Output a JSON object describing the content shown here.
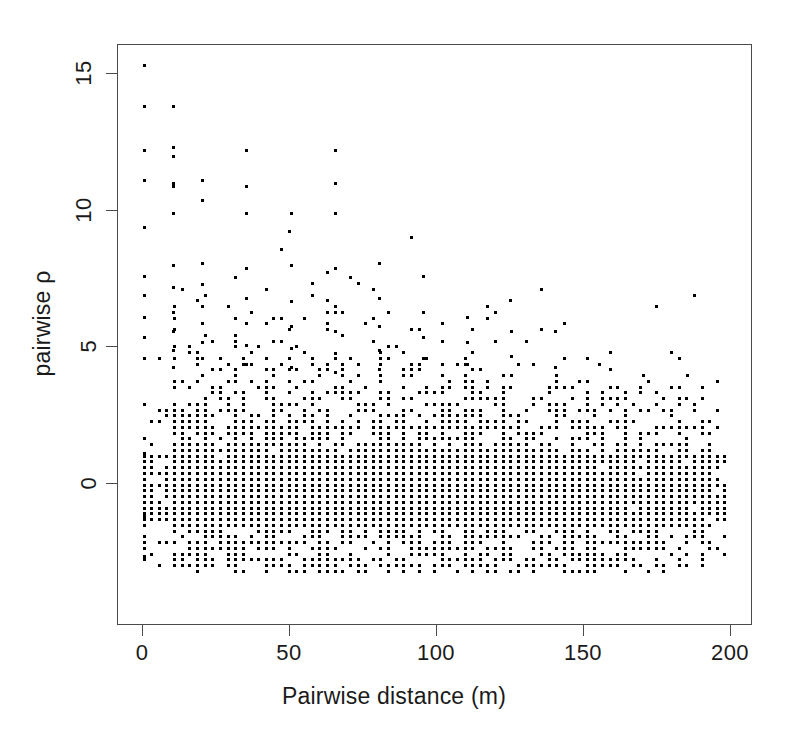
{
  "chart_data": {
    "type": "scatter",
    "title": "",
    "xlabel": "Pairwise distance (m)",
    "ylabel": "pairwise ρ",
    "xlim": [
      -3,
      208
    ],
    "ylim": [
      -4.9,
      16.0
    ],
    "xticks": [
      0,
      50,
      100,
      150,
      200
    ],
    "xticklabels": [
      "0",
      "50",
      "100",
      "150",
      "200"
    ],
    "yticks": [
      0,
      5,
      10,
      15
    ],
    "yticklabels": [
      "0",
      "5",
      "10",
      "15"
    ],
    "grid": false,
    "legend": null,
    "marker": "square",
    "marker_size_px": 3,
    "marker_color": "#000000",
    "n_points_approx": 9000,
    "observed_features": {
      "max_rho": 15.3,
      "min_rho": -4.3,
      "max_distance": 200,
      "min_distance": 0,
      "dense_band_rho_range": [
        -3.2,
        2.2
      ],
      "core_band_rho_range": [
        -1.5,
        1.2
      ],
      "zero_distance_column_rho_range": [
        -2.8,
        3.3
      ],
      "sparse_above_rho": 4.0,
      "density_falloff_distance": 120
    },
    "series": [
      {
        "name": "pairwise comparisons",
        "x_quantum": 2.6,
        "y_quantum": 0.21,
        "points_summary": [
          {
            "distance": 0,
            "rho_values": [
              15.3,
              13.8,
              12.2,
              11.1,
              9.4,
              7.6,
              6.9,
              6.1,
              5.4,
              4.6,
              3.3,
              2.7,
              2.2,
              1.9,
              1.5,
              1.1,
              0.8,
              0.5,
              0.2,
              -0.1,
              -0.4,
              -0.8,
              -1.2,
              -1.6,
              -2.1,
              -2.8
            ]
          },
          {
            "distance": 10,
            "rho_values": [
              13.8,
              12.3,
              12.0,
              11.0,
              10.9,
              9.9,
              8.0,
              7.2,
              6.3,
              5.6,
              4.9,
              4.3,
              3.6,
              3.0,
              2.4,
              1.8,
              1.2,
              0.6,
              0.0,
              -0.6,
              -1.3,
              -1.9,
              -2.5,
              -3.2,
              -3.8,
              -4.3
            ]
          },
          {
            "distance": 20,
            "rho_values": [
              11.1,
              10.4,
              8.1,
              7.3,
              6.5,
              5.9,
              5.2,
              4.6,
              4.0,
              3.4,
              2.8,
              2.2,
              1.6,
              1.0,
              0.4,
              -0.2,
              -0.9,
              -1.5,
              -2.2,
              -2.9,
              -3.5,
              -4.1
            ]
          },
          {
            "distance": 35,
            "rho_values": [
              12.2,
              10.9,
              9.9,
              7.9,
              6.8,
              5.9,
              5.1,
              4.4,
              3.8,
              3.2,
              2.6,
              2.0,
              1.4,
              0.8,
              0.2,
              -0.4,
              -1.0,
              -1.7,
              -2.4,
              -3.1,
              -3.8,
              -4.2
            ]
          },
          {
            "distance": 50,
            "rho_values": [
              9.9,
              8.0,
              6.7,
              5.8,
              5.0,
              4.3,
              3.7,
              3.1,
              2.5,
              1.9,
              1.3,
              0.7,
              0.1,
              -0.5,
              -1.1,
              -1.8,
              -2.5,
              -3.2,
              -3.9
            ]
          },
          {
            "distance": 65,
            "rho_values": [
              12.2,
              11.0,
              9.9,
              7.9,
              6.5,
              5.6,
              4.8,
              4.1,
              3.5,
              2.9,
              2.3,
              1.7,
              1.1,
              0.5,
              -0.1,
              -0.7,
              -1.4,
              -2.1,
              -2.8,
              -3.5,
              -4.2
            ]
          },
          {
            "distance": 80,
            "rho_values": [
              8.1,
              6.8,
              5.8,
              4.9,
              4.2,
              3.6,
              3.0,
              2.4,
              1.8,
              1.2,
              0.6,
              0.0,
              -0.6,
              -1.2,
              -1.9,
              -2.6,
              -3.3,
              -4.0
            ]
          },
          {
            "distance": 95,
            "rho_values": [
              7.6,
              6.3,
              5.4,
              4.6,
              3.9,
              3.3,
              2.7,
              2.1,
              1.5,
              0.9,
              0.3,
              -0.3,
              -0.9,
              -1.6,
              -2.3,
              -3.0,
              -3.7
            ]
          },
          {
            "distance": 110,
            "rho_values": [
              6.1,
              5.2,
              4.4,
              3.8,
              3.2,
              2.6,
              2.0,
              1.4,
              0.8,
              0.2,
              -0.4,
              -1.0,
              -1.7,
              -2.4,
              -3.1,
              -3.8
            ]
          },
          {
            "distance": 125,
            "rho_values": [
              5.6,
              4.7,
              4.0,
              3.4,
              2.8,
              2.2,
              1.6,
              1.0,
              0.4,
              -0.2,
              -0.8,
              -1.5,
              -2.2,
              -2.9,
              -3.6
            ]
          },
          {
            "distance": 140,
            "rho_values": [
              5.6,
              4.3,
              3.6,
              3.0,
              2.4,
              1.8,
              1.2,
              0.6,
              0.0,
              -0.6,
              -1.3,
              -2.0,
              -2.7,
              -3.4
            ]
          },
          {
            "distance": 155,
            "rho_values": [
              4.4,
              3.6,
              3.0,
              2.5,
              1.9,
              1.3,
              0.7,
              0.1,
              -0.5,
              -1.2,
              -1.9,
              -2.6,
              -3.3
            ]
          },
          {
            "distance": 170,
            "rho_values": [
              4.0,
              3.3,
              2.7,
              2.2,
              1.6,
              1.0,
              0.4,
              -0.2,
              -0.9,
              -1.6,
              -2.3,
              -3.0
            ]
          },
          {
            "distance": 185,
            "rho_values": [
              4.0,
              3.1,
              2.5,
              2.0,
              1.4,
              0.8,
              0.2,
              -0.4,
              -1.1,
              -1.8,
              -2.5
            ]
          },
          {
            "distance": 197,
            "rho_values": [
              2.2,
              1.7,
              1.2,
              0.7,
              0.2,
              -0.3,
              -0.9,
              -1.5,
              -2.1
            ]
          }
        ]
      }
    ]
  },
  "axes": {
    "x_axis_name": "pairwise-distance-axis",
    "y_axis_name": "pairwise-rho-axis"
  }
}
